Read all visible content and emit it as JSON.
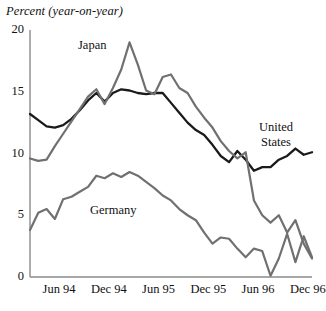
{
  "chart_data": {
    "type": "line",
    "title": "Percent (year-on-year)",
    "xlabel": "",
    "ylabel": "Percent (year-on-year)",
    "ylim": [
      0,
      20
    ],
    "yticks": [
      0,
      5,
      10,
      15,
      20
    ],
    "ytick_labels": [
      "0",
      "5",
      "10",
      "15",
      "20"
    ],
    "xticks": [
      "Jun 94",
      "Dec 94",
      "Jun 95",
      "Dec 95",
      "Jun 96",
      "Dec 96"
    ],
    "xtick_positions": [
      6,
      12,
      18,
      24,
      30,
      36
    ],
    "x_range": [
      2.5,
      36.5
    ],
    "grid": false,
    "legend": "inline-labels",
    "x": [
      2.5,
      3.5,
      4.5,
      5.5,
      6.5,
      7.5,
      8.5,
      9.5,
      10.5,
      11.5,
      12.5,
      13.5,
      14.5,
      15.5,
      16.5,
      17.5,
      18.5,
      19.5,
      20.5,
      21.5,
      22.5,
      23.5,
      24.5,
      25.5,
      26.5,
      27.5,
      28.5,
      29.5,
      30.5,
      31.5,
      32.5,
      33.5,
      34.5,
      35.5,
      36.5
    ],
    "series": [
      {
        "name": "United States",
        "color": "#1a1a1a",
        "width": 2.3,
        "values": [
          13.2,
          12.7,
          12.2,
          12.1,
          12.3,
          12.8,
          13.5,
          14.3,
          14.9,
          14.2,
          14.9,
          15.2,
          15.1,
          14.9,
          14.8,
          14.9,
          14.9,
          14.1,
          13.3,
          12.5,
          11.9,
          11.5,
          10.7,
          9.8,
          9.3,
          10.2,
          9.5,
          8.6,
          8.9,
          8.9,
          9.5,
          9.8,
          10.4,
          9.9,
          10.1
        ]
      },
      {
        "name": "Japan",
        "color": "#707070",
        "width": 2.2,
        "values": [
          9.6,
          9.4,
          9.5,
          10.6,
          11.6,
          12.6,
          13.6,
          14.6,
          15.2,
          14.0,
          15.3,
          16.8,
          19.0,
          17.2,
          15.1,
          14.8,
          16.2,
          16.4,
          15.3,
          14.9,
          13.8,
          12.9,
          12.1,
          11.0,
          10.2,
          9.6,
          10.1,
          6.2,
          5.0,
          4.4,
          5.0,
          3.6,
          4.6,
          2.7,
          1.5
        ]
      },
      {
        "name": "Germany",
        "color": "#707070",
        "width": 2.2,
        "values": [
          3.8,
          5.2,
          5.5,
          4.7,
          6.3,
          6.5,
          6.9,
          7.3,
          8.2,
          8.0,
          8.4,
          8.1,
          8.5,
          8.2,
          7.7,
          7.2,
          6.6,
          6.2,
          5.5,
          5.0,
          4.6,
          3.6,
          2.7,
          3.2,
          3.1,
          2.3,
          1.6,
          2.3,
          2.1,
          0.1,
          1.5,
          3.5,
          1.2,
          3.3,
          1.6
        ]
      }
    ],
    "annotations": [
      {
        "name": "japan-label",
        "text": "Japan",
        "x_px": 78,
        "y_px": 38,
        "lines": [
          "Japan"
        ]
      },
      {
        "name": "united-states-label",
        "text": "United States",
        "x_px": 259,
        "y_px": 120,
        "lines": [
          "United",
          "States"
        ]
      },
      {
        "name": "germany-label",
        "text": "Germany",
        "x_px": 90,
        "y_px": 203,
        "lines": [
          "Germany"
        ]
      }
    ]
  },
  "axes": {
    "plot_left_px": 30,
    "plot_right_px": 312,
    "plot_top_px": 30,
    "plot_bottom_px": 277,
    "axis_color": "#8a8a8a"
  }
}
